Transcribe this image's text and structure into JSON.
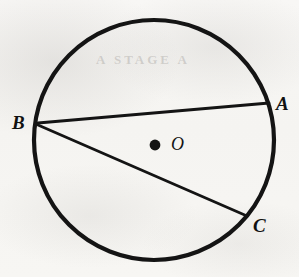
{
  "figure": {
    "background_color": "#f7f6f4",
    "ink_color": "#141414",
    "shapes": {
      "circle": {
        "name": "circle-outline",
        "center_x": 154,
        "center_y": 140,
        "radius": 120,
        "stroke_width": 4.2
      },
      "center_dot": {
        "name": "center-point-O",
        "x": 155,
        "y": 145,
        "radius": 5.4
      },
      "chord_ba": {
        "name": "chord-B-to-A",
        "x1": 38,
        "y1": 123,
        "x2": 269,
        "y2": 103,
        "stroke_width": 2.8
      },
      "chord_bc": {
        "name": "chord-B-to-C",
        "x1": 38,
        "y1": 125,
        "x2": 247,
        "y2": 216,
        "stroke_width": 2.8
      }
    },
    "labels": {
      "a": "A",
      "b": "B",
      "c": "C",
      "o": "O"
    },
    "ghost_text": {
      "top": "A STAGE A",
      "mid": "",
      "bottom": "",
      "left": ""
    }
  }
}
